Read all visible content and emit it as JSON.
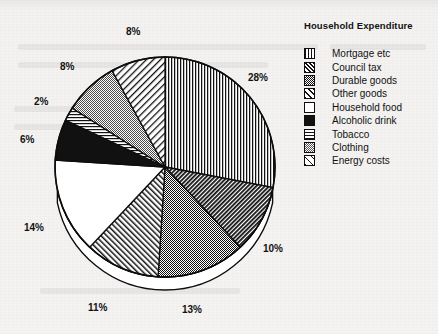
{
  "legend": {
    "title": "Household Expenditure",
    "items": [
      {
        "label": "Mortgage etc",
        "pattern": "vertical-lines"
      },
      {
        "label": "Council tax",
        "pattern": "diagonal-hatch-dark"
      },
      {
        "label": "Durable goods",
        "pattern": "stipple-dark"
      },
      {
        "label": "Other goods",
        "pattern": "diagonal-hatch-light"
      },
      {
        "label": "Household food",
        "pattern": "solid-white"
      },
      {
        "label": "Alcoholic drink",
        "pattern": "solid-black"
      },
      {
        "label": "Tobacco",
        "pattern": "horizontal-lines"
      },
      {
        "label": "Clothing",
        "pattern": "stipple-light"
      },
      {
        "label": "Energy costs",
        "pattern": "diagonal-hatch-thin"
      }
    ]
  },
  "chart_data": {
    "type": "pie",
    "title": "Household Expenditure",
    "xlabel": "",
    "ylabel": "",
    "legend_position": "right",
    "grid": false,
    "start_angle_deg": 0,
    "direction": "clockwise",
    "categories": [
      "Mortgage etc",
      "Council tax",
      "Durable goods",
      "Other goods",
      "Household food",
      "Alcoholic drink",
      "Tobacco",
      "Clothing",
      "Energy costs"
    ],
    "values": [
      28,
      10,
      13,
      11,
      14,
      6,
      2,
      8,
      8
    ],
    "value_labels": [
      "28%",
      "10%",
      "13%",
      "11%",
      "14%",
      "6%",
      "2%",
      "8%",
      "8%"
    ],
    "slices": [
      {
        "label": "Mortgage etc",
        "value": 28,
        "value_label": "28%",
        "pattern": "vertical-lines",
        "label_x": 248,
        "label_y": 72
      },
      {
        "label": "Council tax",
        "value": 10,
        "value_label": "10%",
        "pattern": "diagonal-hatch-dark",
        "label_x": 263,
        "label_y": 243
      },
      {
        "label": "Durable goods",
        "value": 13,
        "value_label": "13%",
        "pattern": "stipple-dark",
        "label_x": 182,
        "label_y": 304
      },
      {
        "label": "Other goods",
        "value": 11,
        "value_label": "11%",
        "pattern": "diagonal-hatch-light",
        "label_x": 88,
        "label_y": 302
      },
      {
        "label": "Household food",
        "value": 14,
        "value_label": "14%",
        "pattern": "solid-white",
        "label_x": 24,
        "label_y": 222
      },
      {
        "label": "Alcoholic drink",
        "value": 6,
        "value_label": "6%",
        "pattern": "solid-black",
        "label_x": 20,
        "label_y": 134
      },
      {
        "label": "Tobacco",
        "value": 2,
        "value_label": "2%",
        "pattern": "horizontal-lines",
        "label_x": 34,
        "label_y": 96
      },
      {
        "label": "Clothing",
        "value": 8,
        "value_label": "8%",
        "pattern": "stipple-light",
        "label_x": 60,
        "label_y": 61
      },
      {
        "label": "Energy costs",
        "value": 8,
        "value_label": "8%",
        "pattern": "diagonal-hatch-thin",
        "label_x": 126,
        "label_y": 26
      }
    ]
  },
  "colors": {
    "ink": "#111111",
    "paper": "#f3f2f1",
    "outline": "#0d0d0d"
  }
}
